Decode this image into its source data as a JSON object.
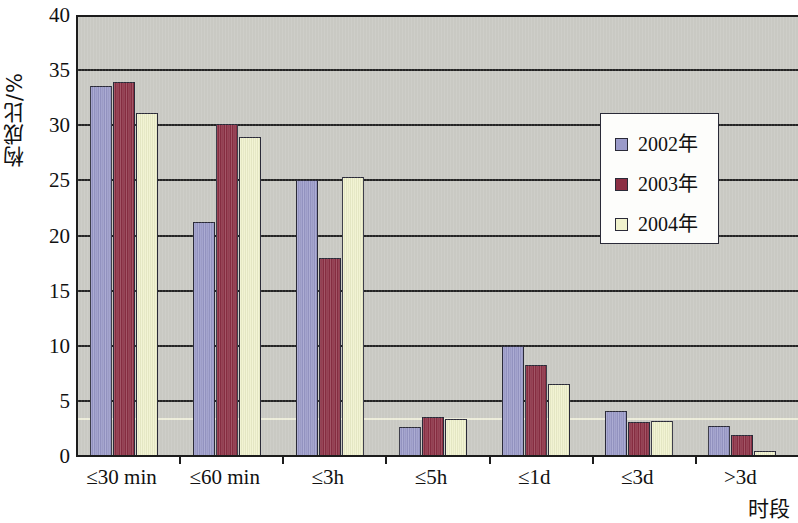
{
  "chart_data": {
    "type": "bar",
    "title": "",
    "xlabel": "时段",
    "ylabel": "构成比/%",
    "ylim": [
      0,
      40
    ],
    "yticks": [
      0,
      5,
      10,
      15,
      20,
      25,
      30,
      35,
      40
    ],
    "grid": true,
    "legend_position": "inside-upper-right",
    "categories": [
      "≤30 min",
      "≤60 min",
      "≤3h",
      "≤5h",
      "≤1d",
      "≤3d",
      ">3d"
    ],
    "series": [
      {
        "name": "2002年",
        "color": "#9a9ac9",
        "values": [
          33.6,
          21.2,
          25.0,
          2.6,
          10.0,
          4.1,
          2.7
        ]
      },
      {
        "name": "2003年",
        "color": "#8c2f44",
        "values": [
          33.9,
          30.1,
          18.0,
          3.5,
          8.3,
          3.1,
          1.9
        ]
      },
      {
        "name": "2004年",
        "color": "#f0f2cd",
        "values": [
          31.1,
          28.9,
          25.3,
          3.4,
          6.5,
          3.2,
          0.45
        ]
      }
    ]
  },
  "legend": {
    "entries": [
      {
        "label": "2002年"
      },
      {
        "label": "2003年"
      },
      {
        "label": "2004年"
      }
    ]
  },
  "colors": {
    "series_2002": "#9a9ac9",
    "series_2003": "#8c2f44",
    "series_2004": "#f0f2cd",
    "plot_background": "#c9c9c3",
    "gridline": "#242424",
    "axis": "#1c1c1c",
    "page_background": "#ffffff"
  }
}
